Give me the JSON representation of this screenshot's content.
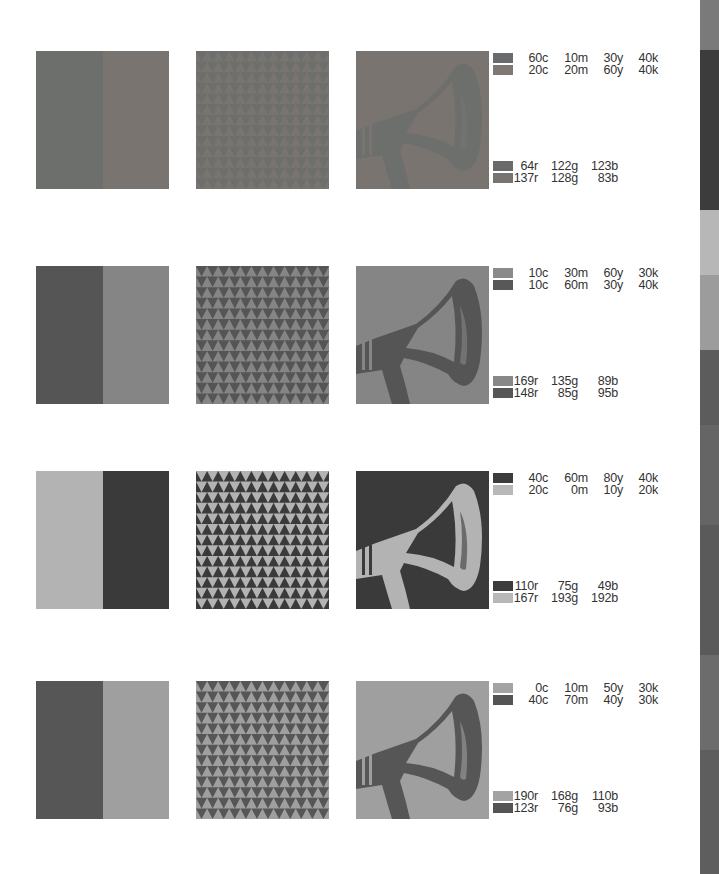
{
  "rows": [
    {
      "colorA": "#6c6f6c",
      "colorB": "#7a7470",
      "cmyk": [
        {
          "c": "60c",
          "m": "10m",
          "y": "30y",
          "k": "40k",
          "swatch": "#6a6b6c"
        },
        {
          "c": "20c",
          "m": "20m",
          "y": "60y",
          "k": "40k",
          "swatch": "#7d7873"
        }
      ],
      "rgb": [
        {
          "r": "64r",
          "g": "122g",
          "b": "123b",
          "swatch": "#6a6a6b"
        },
        {
          "r": "137r",
          "g": "128g",
          "b": "83b",
          "swatch": "#777471"
        }
      ]
    },
    {
      "colorA": "#555555",
      "colorB": "#858585",
      "cmyk": [
        {
          "c": "10c",
          "m": "30m",
          "y": "60y",
          "k": "30k",
          "swatch": "#8a8a8a"
        },
        {
          "c": "10c",
          "m": "60m",
          "y": "30y",
          "k": "40k",
          "swatch": "#585858"
        }
      ],
      "rgb": [
        {
          "r": "169r",
          "g": "135g",
          "b": "89b",
          "swatch": "#888888"
        },
        {
          "r": "148r",
          "g": "85g",
          "b": "95b",
          "swatch": "#575757"
        }
      ]
    },
    {
      "colorA": "#b3b3b3",
      "colorB": "#3a3a3a",
      "cmyk": [
        {
          "c": "40c",
          "m": "60m",
          "y": "80y",
          "k": "40k",
          "swatch": "#3c3c3c"
        },
        {
          "c": "20c",
          "m": "0m",
          "y": "10y",
          "k": "20k",
          "swatch": "#b8b8b8"
        }
      ],
      "rgb": [
        {
          "r": "110r",
          "g": "75g",
          "b": "49b",
          "swatch": "#3c3c3c"
        },
        {
          "r": "167r",
          "g": "193g",
          "b": "192b",
          "swatch": "#b8b8b8"
        }
      ]
    },
    {
      "colorA": "#565656",
      "colorB": "#9f9f9f",
      "cmyk": [
        {
          "c": "0c",
          "m": "10m",
          "y": "50y",
          "k": "30k",
          "swatch": "#a3a3a3"
        },
        {
          "c": "40c",
          "m": "70m",
          "y": "40y",
          "k": "30k",
          "swatch": "#545454"
        }
      ],
      "rgb": [
        {
          "r": "190r",
          "g": "168g",
          "b": "110b",
          "swatch": "#a3a3a3"
        },
        {
          "r": "123r",
          "g": "76g",
          "b": "93b",
          "swatch": "#545454"
        }
      ]
    }
  ],
  "strip": [
    {
      "color": "#7a7a7a",
      "h": 50
    },
    {
      "color": "#3c3c3c",
      "h": 160
    },
    {
      "color": "#b7b7b7",
      "h": 65
    },
    {
      "color": "#9c9c9c",
      "h": 75
    },
    {
      "color": "#5c5c5c",
      "h": 75
    },
    {
      "color": "#656565",
      "h": 100
    },
    {
      "color": "#5a5a5a",
      "h": 130
    },
    {
      "color": "#6c6c6c",
      "h": 95
    },
    {
      "color": "#5e5e5e",
      "h": 124
    }
  ]
}
